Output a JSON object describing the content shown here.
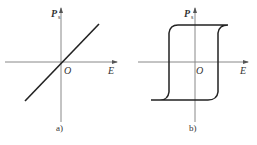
{
  "panels": [
    {
      "id": "a",
      "caption": "a)",
      "y_axis_label": "P",
      "y_axis_subscript": "s",
      "x_axis_label": "E",
      "origin_label": "O",
      "curve": "linear"
    },
    {
      "id": "b",
      "caption": "b)",
      "y_axis_label": "P",
      "y_axis_subscript": "s",
      "x_axis_label": "E",
      "origin_label": "O",
      "curve": "hysteresis-loop"
    }
  ],
  "colors": {
    "axis": "#888888",
    "curve": "#222222",
    "text": "#333333"
  }
}
